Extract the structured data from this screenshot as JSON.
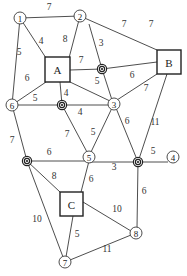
{
  "diagram": {
    "type": "weighted-network-graph",
    "colors": {
      "line": "#3a3a3a",
      "text": "#222222",
      "background": "#ffffff"
    },
    "circle_nodes": [
      {
        "id": "1",
        "label": "1",
        "x": 20,
        "y": 18
      },
      {
        "id": "2",
        "label": "2",
        "x": 80,
        "y": 16
      },
      {
        "id": "3",
        "label": "3",
        "x": 114,
        "y": 104
      },
      {
        "id": "4",
        "label": "4",
        "x": 173,
        "y": 157
      },
      {
        "id": "5",
        "label": "5",
        "x": 89,
        "y": 157
      },
      {
        "id": "6",
        "label": "6",
        "x": 12,
        "y": 105
      },
      {
        "id": "7",
        "label": "7",
        "x": 65,
        "y": 262
      },
      {
        "id": "8",
        "label": "8",
        "x": 136,
        "y": 233
      }
    ],
    "box_nodes": [
      {
        "id": "A",
        "label": "A",
        "x": 45,
        "y": 57,
        "w": 25,
        "h": 25
      },
      {
        "id": "B",
        "label": "B",
        "x": 157,
        "y": 50,
        "w": 24,
        "h": 24
      },
      {
        "id": "C",
        "label": "C",
        "x": 60,
        "y": 192,
        "w": 23,
        "h": 24
      }
    ],
    "junction_nodes": [
      {
        "id": "J1",
        "x": 102,
        "y": 69
      },
      {
        "id": "J2",
        "x": 62,
        "y": 105
      },
      {
        "id": "J3",
        "x": 138,
        "y": 162
      },
      {
        "id": "J4",
        "x": 27,
        "y": 161
      }
    ],
    "edges": [
      {
        "from": "1",
        "to": "2",
        "weight": "7",
        "x1": 20,
        "y1": 18,
        "x2": 80,
        "y2": 16,
        "lx": 49,
        "ly": 7
      },
      {
        "from": "1",
        "to": "A",
        "weight": "4",
        "x1": 20,
        "y1": 18,
        "x2": 46,
        "y2": 58,
        "lx": 41,
        "ly": 41
      },
      {
        "from": "1",
        "to": "6",
        "weight": "5",
        "x1": 20,
        "y1": 18,
        "x2": 12,
        "y2": 105,
        "lx": 19,
        "ly": 52
      },
      {
        "from": "2",
        "to": "A",
        "weight": "8",
        "x1": 80,
        "y1": 16,
        "x2": 69,
        "y2": 58,
        "lx": 65,
        "ly": 39
      },
      {
        "from": "2",
        "to": "J1",
        "weight": "3",
        "x1": 89,
        "y1": 24,
        "x2": 102,
        "y2": 69,
        "lx": 101,
        "ly": 43
      },
      {
        "from": "2",
        "to": "B",
        "weight": "7",
        "x1": 80,
        "y1": 16,
        "x2": 157,
        "y2": 50,
        "lx": 124,
        "ly": 24
      },
      {
        "from": "A",
        "to": "J1",
        "weight": "7",
        "x1": 70,
        "y1": 70,
        "x2": 102,
        "y2": 69,
        "lx": 81,
        "ly": 60
      },
      {
        "from": "J1",
        "to": "B",
        "weight": "6",
        "x1": 102,
        "y1": 69,
        "x2": 157,
        "y2": 62,
        "lx": 132,
        "ly": 75
      },
      {
        "from": "J1",
        "to": "3",
        "weight": "5",
        "x1": 102,
        "y1": 69,
        "x2": 112,
        "y2": 100,
        "lx": 97,
        "ly": 81
      },
      {
        "from": "A",
        "to": "3",
        "weight": "",
        "x1": 70,
        "y1": 82,
        "x2": 110,
        "y2": 101
      },
      {
        "from": "3",
        "to": "B",
        "weight": "7",
        "x1": 117,
        "y1": 100,
        "x2": 157,
        "y2": 74,
        "lx": 146,
        "ly": 88
      },
      {
        "from": "A",
        "to": "J2",
        "weight": "4",
        "x1": 60,
        "y1": 82,
        "x2": 62,
        "y2": 105,
        "lx": 66,
        "ly": 93
      },
      {
        "from": "A",
        "to": "6",
        "weight": "5",
        "x1": 46,
        "y1": 82,
        "x2": 12,
        "y2": 105,
        "lx": 35,
        "ly": 98
      },
      {
        "from": "A",
        "to": "6",
        "weight_alt": "6",
        "lx": 27,
        "ly": 78
      },
      {
        "from": "6",
        "to": "J2",
        "weight": "",
        "x1": 12,
        "y1": 105,
        "x2": 62,
        "y2": 105
      },
      {
        "from": "J2",
        "to": "3",
        "weight": "4",
        "x1": 62,
        "y1": 105,
        "x2": 109,
        "y2": 105,
        "lx": 80,
        "ly": 112
      },
      {
        "from": "J2",
        "to": "5",
        "weight": "7",
        "x1": 62,
        "y1": 105,
        "x2": 87,
        "y2": 152,
        "lx": 67,
        "ly": 134
      },
      {
        "from": "3",
        "to": "5",
        "weight": "5",
        "x1": 112,
        "y1": 108,
        "x2": 91,
        "y2": 152,
        "lx": 93,
        "ly": 132
      },
      {
        "from": "3",
        "to": "J3",
        "weight": "6",
        "x1": 116,
        "y1": 108,
        "x2": 138,
        "y2": 162,
        "lx": 127,
        "ly": 121
      },
      {
        "from": "B",
        "to": "J3",
        "weight": "11",
        "x1": 167,
        "y1": 74,
        "x2": 138,
        "y2": 162,
        "lx": 155,
        "ly": 122
      },
      {
        "from": "J3",
        "to": "4",
        "weight": "5",
        "x1": 138,
        "y1": 162,
        "x2": 168,
        "y2": 162,
        "lx": 153,
        "ly": 151
      },
      {
        "from": "6",
        "to": "J4",
        "weight": "7",
        "x1": 12,
        "y1": 105,
        "x2": 27,
        "y2": 161,
        "lx": 12,
        "ly": 140
      },
      {
        "from": "J4",
        "to": "5",
        "weight": "6",
        "x1": 27,
        "y1": 161,
        "x2": 89,
        "y2": 161,
        "lx": 49,
        "ly": 152
      },
      {
        "from": "5",
        "to": "J3",
        "weight": "3",
        "x1": 89,
        "y1": 162,
        "x2": 138,
        "y2": 162,
        "lx": 114,
        "ly": 167
      },
      {
        "from": "J4",
        "to": "C",
        "weight": "8",
        "x1": 27,
        "y1": 161,
        "x2": 60,
        "y2": 192,
        "lx": 54,
        "ly": 176
      },
      {
        "from": "5",
        "to": "C",
        "weight": "6",
        "x1": 89,
        "y1": 161,
        "x2": 81,
        "y2": 192,
        "lx": 91,
        "ly": 179
      },
      {
        "from": "J3",
        "to": "8",
        "weight": "6",
        "x1": 138,
        "y1": 162,
        "x2": 137,
        "y2": 228,
        "lx": 144,
        "ly": 191
      },
      {
        "from": "C",
        "to": "8",
        "weight": "10",
        "x1": 83,
        "y1": 202,
        "x2": 131,
        "y2": 231,
        "lx": 117,
        "ly": 209
      },
      {
        "from": "J4",
        "to": "7",
        "weight": "10",
        "x1": 27,
        "y1": 161,
        "x2": 63,
        "y2": 257,
        "lx": 37,
        "ly": 219
      },
      {
        "from": "C",
        "to": "7",
        "weight": "5",
        "x1": 73,
        "y1": 216,
        "x2": 66,
        "y2": 257,
        "lx": 77,
        "ly": 234
      },
      {
        "from": "7",
        "to": "8",
        "weight": "11",
        "x1": 70,
        "y1": 260,
        "x2": 131,
        "y2": 235,
        "lx": 107,
        "ly": 249
      }
    ],
    "extra_labels": [
      {
        "text": "6",
        "x": 27,
        "y": 78
      },
      {
        "text": "7",
        "x": 151,
        "y": 24
      }
    ]
  }
}
